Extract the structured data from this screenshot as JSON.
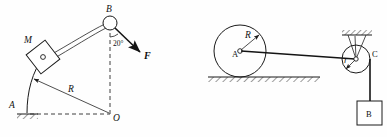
{
  "figure": {
    "background_color": "#fefefe",
    "line_color": "#1a1a1a",
    "panels": [
      {
        "id": "left",
        "name": "curved-bar-panel",
        "labels": {
          "point_b": "B",
          "point_a": "A",
          "point_o": "O",
          "block_m": "M",
          "radius_r": "R",
          "force_f": "F",
          "angle": "20°"
        }
      },
      {
        "id": "right",
        "name": "wheel-pulley-panel",
        "labels": {
          "wheel_center_a": "A",
          "wheel_radius_r": "R",
          "pulley_radius_r": "r",
          "pulley_c": "C",
          "block_b": "B"
        }
      }
    ]
  }
}
